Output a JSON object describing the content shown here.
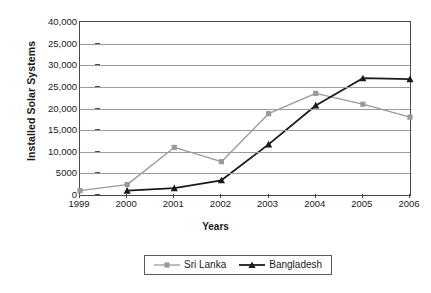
{
  "chart_data": {
    "type": "line",
    "title": "",
    "xlabel": "Years",
    "ylabel": "Installed Solar Systems",
    "categories": [
      "1999",
      "2000",
      "2001",
      "2002",
      "2003",
      "2004",
      "2005",
      "2006"
    ],
    "x": [
      1999,
      2000,
      2001,
      2002,
      2003,
      2004,
      2005,
      2006
    ],
    "ylim": [
      0,
      40000
    ],
    "xlim": [
      1999,
      2006
    ],
    "grid": true,
    "grid_axis": "y",
    "legend_position": "bottom-center",
    "ytick_values": [
      40000,
      35000,
      30000,
      25000,
      20000,
      15000,
      10000,
      5000,
      0
    ],
    "ytick_labels": [
      "40,000",
      "25,000",
      "30,000",
      "25,000",
      "20,000",
      "15,000",
      "10,000",
      "5000",
      "0"
    ],
    "xtick_labels": [
      "1999",
      "2000",
      "2001",
      "2002",
      "2003",
      "2004",
      "2005",
      "2006"
    ],
    "series": [
      {
        "name": "Sri Lanka",
        "color": "#9a9a9a",
        "marker": "square",
        "values": [
          1000,
          2400,
          11000,
          7700,
          18800,
          23500,
          21000,
          18000
        ]
      },
      {
        "name": "Bangladesh",
        "color": "#1a1a1a",
        "marker": "triangle",
        "values": [
          null,
          1000,
          1600,
          3400,
          11700,
          20700,
          27000,
          26800
        ]
      }
    ]
  },
  "legend": {
    "entries": [
      {
        "label": "Sri Lanka"
      },
      {
        "label": "Bangladesh"
      }
    ]
  }
}
